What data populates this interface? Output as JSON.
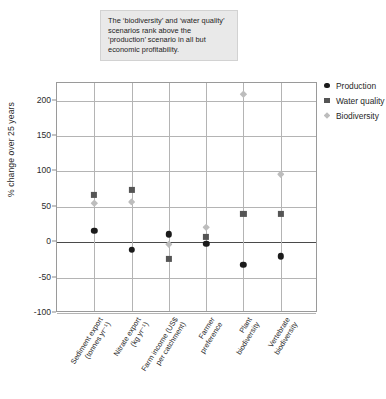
{
  "annotation": {
    "text": "The ‘biodiversity’ and ‘water quality’ scenarios rank above the ‘production’ scenario in all but economic profitability."
  },
  "chart_data": {
    "type": "scatter",
    "title": "",
    "xlabel": "",
    "ylabel": "% change over 25 years",
    "ylim": [
      -100,
      225
    ],
    "yticks": [
      200,
      150,
      100,
      50,
      0,
      -50,
      -100
    ],
    "ytick_labels": [
      "200",
      "150",
      "100",
      "50",
      "0",
      "-50",
      "-100"
    ],
    "grid": true,
    "legend_position": "right",
    "categories": [
      "Sediment export (tonnes yr⁻¹)",
      "Nitrate export (kg yr⁻¹)",
      "Farm income (US$ per catchment)",
      "Farmer preference",
      "Plant biodiversity",
      "Vertebrate biodiversity"
    ],
    "category_lines": [
      [
        "Sediment export",
        "(tonnes yr⁻¹)"
      ],
      [
        "Nitrate export",
        "(kg yr⁻¹)"
      ],
      [
        "Farm income (US$",
        "per catchment)"
      ],
      [
        "Farmer",
        "preference"
      ],
      [
        "Plant",
        "biodiversity"
      ],
      [
        "Vertebrate",
        "biodiversity"
      ]
    ],
    "series": [
      {
        "name": "Production",
        "marker": "circle",
        "color": "#1b1b1b",
        "values": [
          16,
          -11,
          11,
          -2,
          -32,
          -20
        ]
      },
      {
        "name": "Water quality",
        "marker": "square",
        "color": "#555555",
        "values": [
          67,
          74,
          -23,
          7,
          40,
          40
        ]
      },
      {
        "name": "Biodiversity",
        "marker": "diamond",
        "color": "#bdbdbd",
        "values": [
          55,
          57,
          -3,
          21,
          209,
          96
        ]
      }
    ]
  },
  "legend": {
    "items": [
      {
        "label": "Production",
        "icon": "circle-marker-icon"
      },
      {
        "label": "Water quality",
        "icon": "square-marker-icon"
      },
      {
        "label": "Biodiversity",
        "icon": "diamond-marker-icon"
      }
    ]
  }
}
